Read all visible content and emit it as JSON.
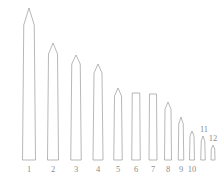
{
  "figure": {
    "kind": "obelisk-height-comparison-line-drawing",
    "background_color": "#ffffff",
    "stroke_color": "#9a9a9a",
    "fill_color": "#ffffff",
    "label_color": "#8d8d8d",
    "baseline_y": 160,
    "canvas": {
      "width": 221,
      "height": 183
    }
  },
  "chart_data": {
    "type": "bar",
    "title": "",
    "subtitle": "",
    "xlabel": "",
    "ylabel": "",
    "grid": false,
    "legend": null,
    "axis_visible": false,
    "orientation": "vertical",
    "baseline_y_px": 160,
    "note": "Heights are measured in pixels from the common baseline to the apex of each pointed (pyramidion) top.",
    "categories": [
      "1",
      "2",
      "3",
      "4",
      "5",
      "6",
      "7",
      "8",
      "9",
      "10",
      "11",
      "12"
    ],
    "values": [
      152,
      117,
      105,
      96,
      72,
      67,
      66,
      58,
      43,
      29,
      24,
      15
    ],
    "ylim": [
      0,
      160
    ]
  },
  "items": [
    {
      "label": "1",
      "center_x": 29,
      "shaft_top_width": 10.5,
      "base_width": 13.0,
      "top_y": 8,
      "tip_height": 17,
      "tip": "pointed",
      "label_x": 29,
      "label_y": 164,
      "label_placement": "below-baseline"
    },
    {
      "label": "2",
      "center_x": 53,
      "shaft_top_width": 9.0,
      "base_width": 11.0,
      "top_y": 43,
      "tip_height": 11,
      "tip": "pointed",
      "label_x": 53,
      "label_y": 164,
      "label_placement": "below-baseline"
    },
    {
      "label": "3",
      "center_x": 76,
      "shaft_top_width": 8.5,
      "base_width": 10.5,
      "top_y": 55,
      "tip_height": 9,
      "tip": "pointed",
      "label_x": 76,
      "label_y": 164,
      "label_placement": "below-baseline"
    },
    {
      "label": "4",
      "center_x": 98,
      "shaft_top_width": 8.0,
      "base_width": 10.0,
      "top_y": 64,
      "tip_height": 9,
      "tip": "pointed",
      "label_x": 98,
      "label_y": 164,
      "label_placement": "below-baseline"
    },
    {
      "label": "5",
      "center_x": 118,
      "shaft_top_width": 7.0,
      "base_width": 8.5,
      "top_y": 88,
      "tip_height": 8,
      "tip": "pointed",
      "label_x": 118,
      "label_y": 164,
      "label_placement": "below-baseline"
    },
    {
      "label": "6",
      "center_x": 136,
      "shaft_top_width": 7.5,
      "base_width": 8.5,
      "top_y": 93,
      "tip_height": 0,
      "tip": "flat",
      "label_x": 136,
      "label_y": 164,
      "label_placement": "below-baseline"
    },
    {
      "label": "7",
      "center_x": 153,
      "shaft_top_width": 7.0,
      "base_width": 8.0,
      "top_y": 94,
      "tip_height": 0,
      "tip": "flat",
      "label_x": 153,
      "label_y": 164,
      "label_placement": "below-baseline"
    },
    {
      "label": "8",
      "center_x": 168,
      "shaft_top_width": 6.0,
      "base_width": 7.0,
      "top_y": 102,
      "tip_height": 7,
      "tip": "pointed",
      "label_x": 168,
      "label_y": 164,
      "label_placement": "below-baseline"
    },
    {
      "label": "9",
      "center_x": 181,
      "shaft_top_width": 4.5,
      "base_width": 5.5,
      "top_y": 117,
      "tip_height": 7,
      "tip": "pointed",
      "label_x": 181,
      "label_y": 164,
      "label_placement": "below-baseline"
    },
    {
      "label": "10",
      "center_x": 192,
      "shaft_top_width": 4.0,
      "base_width": 5.0,
      "top_y": 131,
      "tip_height": 5,
      "tip": "pointed",
      "label_x": 192,
      "label_y": 164,
      "label_placement": "below-baseline"
    },
    {
      "label": "11",
      "center_x": 203,
      "shaft_top_width": 3.5,
      "base_width": 4.5,
      "top_y": 136,
      "tip_height": 5,
      "tip": "pointed",
      "label_x": 204,
      "label_y": 124,
      "label_placement": "above-tip"
    },
    {
      "label": "12",
      "center_x": 213,
      "shaft_top_width": 3.5,
      "base_width": 4.0,
      "top_y": 145,
      "tip_height": 4,
      "tip": "pointed",
      "label_x": 213,
      "label_y": 133,
      "label_placement": "above-tip"
    }
  ]
}
